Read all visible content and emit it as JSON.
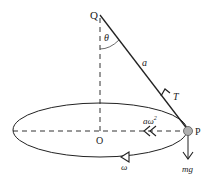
{
  "diagram": {
    "points": {
      "Q": "Q",
      "O": "O",
      "P": "P"
    },
    "labels": {
      "angle": "θ",
      "length": "a",
      "tension": "T",
      "centripetal": "aω",
      "centripetal_exp": "2",
      "weight": "mg",
      "angular_velocity": "ω"
    },
    "colors": {
      "line": "#222222",
      "bob_fill": "#b0b0b0",
      "bob_stroke": "#555555",
      "background": "#ffffff"
    }
  }
}
